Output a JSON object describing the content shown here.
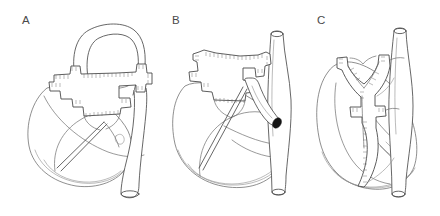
{
  "figure": {
    "kind": "medical-line-illustration",
    "background_color": "#ffffff",
    "line_color": "#4b4b4b",
    "suture_color": "#6a6a6a",
    "lumen_color": "#151515",
    "width": 440,
    "height": 216
  },
  "panels": [
    {
      "id": "panel-a",
      "label": "A",
      "label_x": 27,
      "label_y": 22,
      "caption": "Anterolateral view: cruciform patch graft sutured across aortic arch with ascending aorta loop",
      "features": [
        "ascending-aorta-arch-loop",
        "cruciform-patch-graft",
        "suture-hatching",
        "ventricular-mass",
        "descending-aorta-stump"
      ]
    },
    {
      "id": "panel-b",
      "label": "B",
      "label_x": 177,
      "label_y": 22,
      "caption": "Frontal view: star-shaped patch graft with branch vessels and open vessel lumen",
      "features": [
        "cruciform-patch-graft",
        "suture-hatching",
        "vertical-descending-aorta",
        "branch-vessel-open-lumen",
        "ventricular-mass"
      ]
    },
    {
      "id": "panel-c",
      "label": "C",
      "label_x": 322,
      "label_y": 22,
      "caption": "Posterior view: bifurcated trident graft along descending aorta",
      "features": [
        "trident-branching-graft",
        "suture-hatching",
        "vertical-descending-aorta",
        "ventricular-mass"
      ]
    }
  ]
}
